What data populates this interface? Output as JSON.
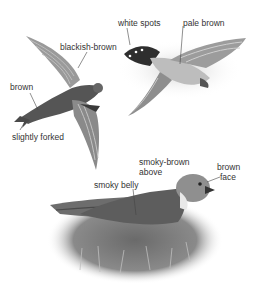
{
  "figure": {
    "birds": [
      {
        "name": "flying-bird-underside",
        "labels": [
          "blackish-brown",
          "brown",
          "slightly forked"
        ]
      },
      {
        "name": "flying-bird-topside",
        "labels": [
          "white spots",
          "pale brown"
        ]
      },
      {
        "name": "perched-bird",
        "labels": [
          "smoky-brown",
          "above",
          "smoky belly",
          "brown",
          "face"
        ]
      }
    ]
  },
  "labels": {
    "blackish_brown": "blackish-brown",
    "brown_left": "brown",
    "slightly_forked": "slightly forked",
    "white_spots": "white spots",
    "pale_brown": "pale brown",
    "smoky_brown_1": "smoky-brown",
    "smoky_brown_2": "above",
    "smoky_belly": "smoky belly",
    "brown_face_1": "brown",
    "brown_face_2": "face"
  }
}
